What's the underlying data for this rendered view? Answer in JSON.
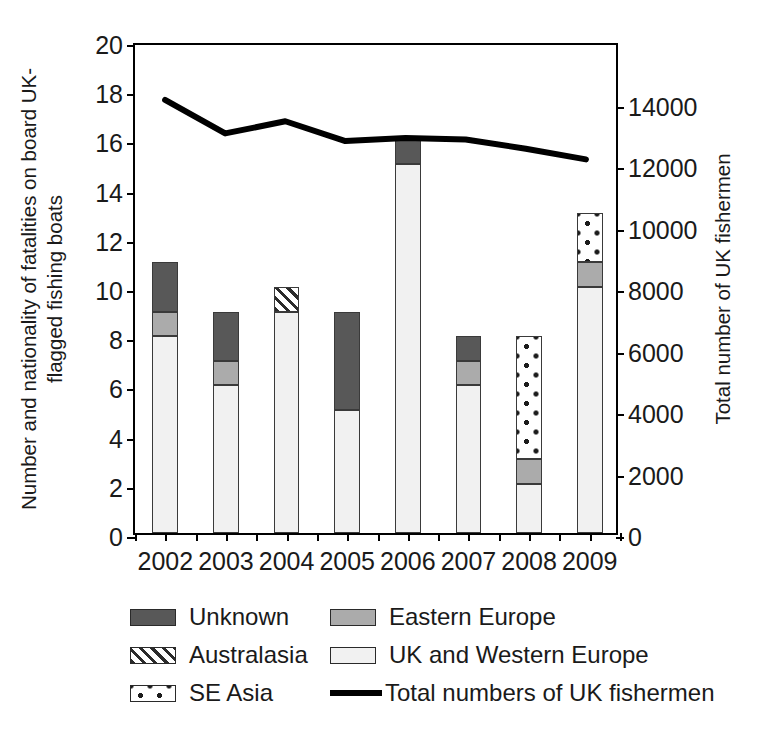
{
  "chart_data": {
    "type": "bar",
    "subtype": "stacked-bar-with-line-overlay",
    "title": "",
    "xlabel": "",
    "ylabel": "Number and nationality of fatalities on board UK-flagged fishing boats",
    "ylabel_right": "Total number of UK fishermen",
    "categories": [
      "2002",
      "2003",
      "2004",
      "2005",
      "2006",
      "2007",
      "2008",
      "2009"
    ],
    "ylim": [
      0,
      20
    ],
    "yticks": [
      0,
      2,
      4,
      6,
      8,
      10,
      12,
      14,
      16,
      18,
      20
    ],
    "ytick_labels": [
      "0",
      "2",
      "4",
      "6",
      "8",
      "10",
      "12",
      "14",
      "16",
      "18",
      "20"
    ],
    "ylim_right": [
      0,
      16000
    ],
    "yticks_right": [
      0,
      2000,
      4000,
      6000,
      8000,
      10000,
      12000,
      14000
    ],
    "ytick_labels_right": [
      "0",
      "2000",
      "4000",
      "6000",
      "8000",
      "10000",
      "12000",
      "14000"
    ],
    "grid": false,
    "legend_position": "below-plot",
    "series": [
      {
        "name": "UK and Western Europe",
        "kind": "bar",
        "stack_order": 1,
        "color": "#f1f1f1",
        "pattern": "solid-light",
        "values": [
          8,
          6,
          9,
          5,
          15,
          6,
          2,
          10
        ]
      },
      {
        "name": "Eastern Europe",
        "kind": "bar",
        "stack_order": 2,
        "color": "#ababab",
        "pattern": "solid-mid-gray",
        "values": [
          1,
          1,
          0,
          0,
          0,
          1,
          1,
          1
        ]
      },
      {
        "name": "SE Asia",
        "kind": "bar",
        "stack_order": 3,
        "color": "#ffffff",
        "pattern": "dotted",
        "values": [
          0,
          0,
          0,
          0,
          0,
          0,
          5,
          2
        ]
      },
      {
        "name": "Australasia",
        "kind": "bar",
        "stack_order": 4,
        "color": "#ffffff",
        "pattern": "diagonal-hatch",
        "values": [
          0,
          0,
          1,
          0,
          0,
          0,
          0,
          0
        ]
      },
      {
        "name": "Unknown",
        "kind": "bar",
        "stack_order": 5,
        "color": "#585858",
        "pattern": "solid-dark-gray",
        "values": [
          2,
          2,
          0,
          4,
          1,
          1,
          0,
          0
        ]
      },
      {
        "name": "Total numbers of UK fishermen",
        "kind": "line",
        "color": "#000000",
        "axis": "right",
        "values": [
          14200,
          13100,
          13500,
          12850,
          12950,
          12900,
          12600,
          12250
        ]
      }
    ],
    "bar_totals": [
      11,
      9,
      10,
      9,
      16,
      8,
      8,
      13
    ]
  },
  "axis_left": {
    "title": "Number and nationality of fatalities on board UK-flagged fishing boats",
    "ticks": [
      "20",
      "18",
      "16",
      "14",
      "12",
      "10",
      "8",
      "6",
      "4",
      "2",
      "0"
    ]
  },
  "axis_right": {
    "title": "Total number of UK fishermen",
    "ticks": [
      "14000",
      "12000",
      "10000",
      "8000",
      "6000",
      "4000",
      "2000",
      "0"
    ]
  },
  "axis_x": {
    "ticks": [
      "2002",
      "2003",
      "2004",
      "2005",
      "2006",
      "2007",
      "2008",
      "2009"
    ]
  },
  "legend": {
    "rows": [
      {
        "left": {
          "label": "Unknown",
          "swatch": "solid-dark-gray"
        },
        "right": {
          "label": "Eastern Europe",
          "swatch": "solid-mid-gray"
        }
      },
      {
        "left": {
          "label": "Australasia",
          "swatch": "diagonal-hatch"
        },
        "right": {
          "label": "UK and Western Europe",
          "swatch": "solid-light"
        }
      },
      {
        "left": {
          "label": "SE Asia",
          "swatch": "dotted"
        },
        "right": {
          "label": "Total numbers of UK fishermen",
          "swatch": "line"
        }
      }
    ]
  },
  "colors": {
    "unknown": "#585858",
    "eastern_europe": "#ababab",
    "uk_western_europe": "#f1f1f1",
    "australasia": "#ffffff",
    "se_asia": "#ffffff",
    "line": "#000000",
    "axis": "#000000"
  }
}
